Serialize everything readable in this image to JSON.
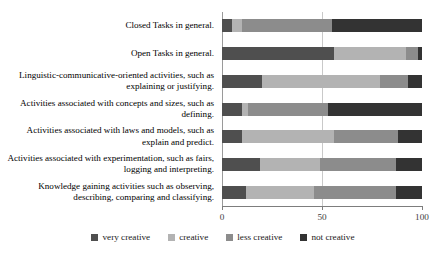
{
  "chart_data": {
    "type": "bar",
    "orientation": "horizontal",
    "stacked": true,
    "stack_mode": "percent",
    "title": "",
    "subtitle": "",
    "xlabel": "",
    "ylabel": "",
    "xlim": [
      0,
      100
    ],
    "xticks": [
      0,
      50,
      100
    ],
    "xtick_labels": [
      "0",
      "50",
      "100"
    ],
    "grid": true,
    "gridlines_x": [
      50
    ],
    "legend_position": "bottom",
    "categories": [
      "Closed Tasks in general.",
      "Open Tasks in general.",
      "Linguistic-communicative-oriented activities, such as explaining or justifying.",
      "Activities associated with concepts and sizes, such as defining.",
      "Activities associated with laws and models, such as explain and predict.",
      "Activities associated with experimentation, such as fairs, logging and interpreting.",
      "Knowledge gaining activities such as observing, describing, comparing and classifying."
    ],
    "series": [
      {
        "name": "very creative",
        "color": "#4f4f4f",
        "values": [
          5,
          56,
          20,
          10,
          10,
          19,
          12
        ]
      },
      {
        "name": "creative",
        "color": "#b3b3b3",
        "values": [
          5,
          36,
          59,
          3,
          46,
          30,
          34
        ]
      },
      {
        "name": "less creative",
        "color": "#8c8c8c",
        "values": [
          45,
          6,
          14,
          40,
          32,
          38,
          41
        ]
      },
      {
        "name": "not creative",
        "color": "#333333",
        "values": [
          45,
          2,
          7,
          47,
          12,
          13,
          13
        ]
      }
    ]
  },
  "legend": {
    "items": [
      {
        "label": "very creative",
        "color": "#4f4f4f"
      },
      {
        "label": "creative",
        "color": "#b3b3b3"
      },
      {
        "label": "less creative",
        "color": "#8c8c8c"
      },
      {
        "label": "not creative",
        "color": "#333333"
      }
    ]
  },
  "axis": {
    "x_tick_labels": [
      "0",
      "50",
      "100"
    ]
  }
}
